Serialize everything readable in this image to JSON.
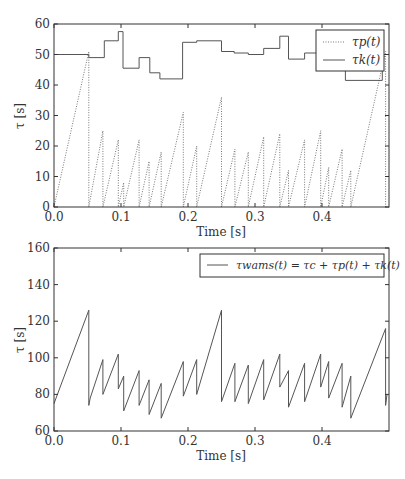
{
  "chart_data": [
    {
      "type": "line",
      "title": "",
      "xlabel": "Time [s]",
      "ylabel": "τ [s]",
      "xlim": [
        0.0,
        0.5
      ],
      "ylim": [
        0,
        60
      ],
      "grid": false,
      "legend_position": "upper right",
      "x_ticks": [
        "0.0",
        "0.1",
        "0.2",
        "0.3",
        "0.4"
      ],
      "y_ticks": [
        "0",
        "10",
        "20",
        "30",
        "40",
        "50",
        "60"
      ],
      "series": [
        {
          "name": "τp(t)",
          "style": "dotted",
          "x": [
            0.0,
            0.052,
            0.052,
            0.073,
            0.073,
            0.096,
            0.096,
            0.104,
            0.104,
            0.127,
            0.127,
            0.142,
            0.142,
            0.16,
            0.16,
            0.193,
            0.193,
            0.213,
            0.213,
            0.25,
            0.25,
            0.27,
            0.27,
            0.29,
            0.29,
            0.313,
            0.313,
            0.337,
            0.337,
            0.35,
            0.35,
            0.374,
            0.374,
            0.398,
            0.398,
            0.41,
            0.41,
            0.43,
            0.43,
            0.443,
            0.443,
            0.495,
            0.495
          ],
          "y": [
            0,
            51,
            0,
            25,
            0,
            22,
            0,
            8,
            0,
            22,
            0,
            15,
            0,
            18,
            0,
            31,
            0,
            20,
            0,
            36,
            0,
            19,
            0,
            18,
            0,
            23,
            0,
            24,
            0,
            12,
            0,
            22,
            0,
            25,
            0,
            13,
            0,
            19,
            0,
            12,
            0,
            51,
            0
          ]
        },
        {
          "name": "τk(t)",
          "style": "solid",
          "x": [
            0.0,
            0.052,
            0.052,
            0.075,
            0.075,
            0.096,
            0.096,
            0.103,
            0.103,
            0.127,
            0.127,
            0.143,
            0.143,
            0.158,
            0.158,
            0.192,
            0.192,
            0.213,
            0.213,
            0.25,
            0.25,
            0.269,
            0.269,
            0.29,
            0.29,
            0.313,
            0.313,
            0.337,
            0.337,
            0.35,
            0.35,
            0.374,
            0.374,
            0.398,
            0.398,
            0.435,
            0.435,
            0.49,
            0.49,
            0.497
          ],
          "y": [
            50,
            50,
            49,
            49,
            54.5,
            54.5,
            57.5,
            57.5,
            45.5,
            45.5,
            49,
            49,
            44,
            44,
            42,
            42,
            54,
            54,
            54.5,
            54.5,
            51,
            51,
            50.5,
            50.5,
            50,
            50,
            52,
            52,
            56,
            56,
            48.5,
            48.5,
            50.5,
            50.5,
            48,
            48,
            41.5,
            41.5,
            50,
            50
          ]
        }
      ]
    },
    {
      "type": "line",
      "title": "",
      "xlabel": "Time [s]",
      "ylabel": "τ [s]",
      "xlim": [
        0.0,
        0.5
      ],
      "ylim": [
        60,
        160
      ],
      "grid": false,
      "legend_position": "upper right",
      "x_ticks": [
        "0.0",
        "0.1",
        "0.2",
        "0.3",
        "0.4"
      ],
      "y_ticks": [
        "60",
        "80",
        "100",
        "120",
        "140",
        "160"
      ],
      "series": [
        {
          "name": "τwams(t) = τc + τp(t) + τk(t)",
          "style": "solid",
          "x": [
            0.0,
            0.052,
            0.052,
            0.054,
            0.073,
            0.073,
            0.096,
            0.096,
            0.104,
            0.104,
            0.127,
            0.127,
            0.142,
            0.142,
            0.16,
            0.16,
            0.193,
            0.193,
            0.213,
            0.213,
            0.25,
            0.25,
            0.27,
            0.27,
            0.29,
            0.29,
            0.313,
            0.313,
            0.337,
            0.337,
            0.35,
            0.35,
            0.374,
            0.374,
            0.398,
            0.398,
            0.41,
            0.41,
            0.43,
            0.43,
            0.443,
            0.443,
            0.495,
            0.495,
            0.497
          ],
          "y": [
            75,
            126,
            74,
            78,
            99,
            80,
            102,
            83,
            90,
            71,
            93,
            74,
            88,
            69,
            86,
            67,
            98,
            79,
            99,
            80,
            126,
            76,
            97,
            76,
            96,
            75,
            99,
            77,
            102,
            84,
            93,
            73,
            97,
            76,
            102,
            84,
            98,
            78,
            97,
            73,
            90,
            67,
            116,
            74,
            80
          ]
        }
      ]
    }
  ],
  "plots": {
    "top": {
      "xlabel": "Time [s]",
      "ylabel": "τ [s]",
      "x_ticks": [
        "0.0",
        "0.1",
        "0.2",
        "0.3",
        "0.4"
      ],
      "y_ticks": [
        "0",
        "10",
        "20",
        "30",
        "40",
        "50",
        "60"
      ],
      "legend": {
        "tau_p": "τp(t)",
        "tau_k": "τk(t)"
      }
    },
    "bottom": {
      "xlabel": "Time [s]",
      "ylabel": "τ [s]",
      "x_ticks": [
        "0.0",
        "0.1",
        "0.2",
        "0.3",
        "0.4"
      ],
      "y_ticks": [
        "60",
        "80",
        "100",
        "120",
        "140",
        "160"
      ],
      "legend": {
        "tau_wams": "τwams(t) = τc + τp(t) + τk(t)"
      }
    }
  },
  "colors": {
    "line": "#555555",
    "axis": "#333333",
    "dotted": "#777777"
  }
}
